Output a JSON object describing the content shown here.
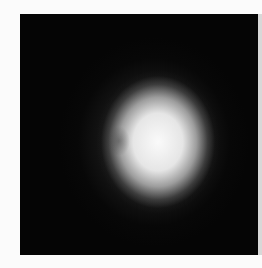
{
  "image": {
    "description": "Grayscale photograph of a diffuse, bright, roughly oval glowing blob centered on a black square background with a white margin",
    "colors": {
      "background": "#fbfbfb",
      "frame": "#050505",
      "glow_core": "#f5f5f5"
    }
  }
}
